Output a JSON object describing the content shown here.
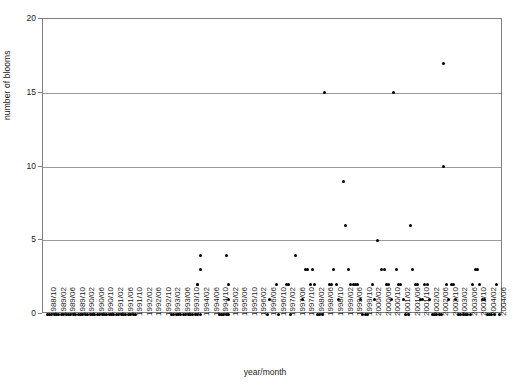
{
  "chart_data": {
    "type": "scatter",
    "title": "",
    "xlabel": "year/month",
    "ylabel": "number of blooms",
    "ylim": [
      0,
      20
    ],
    "yticks": [
      0,
      5,
      10,
      15,
      20
    ],
    "grid": true,
    "legend": false,
    "xtick_labels": [
      "1988/10",
      "1989/02",
      "1989/06",
      "1989/10",
      "1990/02",
      "1990/06",
      "1990/10",
      "1991/02",
      "1991/06",
      "1991/10",
      "1992/02",
      "1992/06",
      "1992/10",
      "1993/02",
      "1993/06",
      "1993/10",
      "1994/02",
      "1994/06",
      "1994/10",
      "1995/02",
      "1995/06",
      "1995/10",
      "1996/02",
      "1996/06",
      "1996/10",
      "1997/02",
      "1997/06",
      "1997/10",
      "1998/02",
      "1998/06",
      "1998/10",
      "1999/02",
      "1999/06",
      "1999/10",
      "2000/02",
      "2000/06",
      "2000/10",
      "2001/02",
      "2001/06",
      "2001/10",
      "2002/02",
      "2002/06",
      "2002/10",
      "2003/02",
      "2003/06",
      "2003/10",
      "2004/02",
      "2004/06"
    ],
    "xtick_step_months": 4,
    "x_start": "1988/10",
    "x_end": "2004/07",
    "x_index_range": [
      0,
      189
    ],
    "point_color": "#000000",
    "axis_color": "#7f7f7f",
    "grid_color": "#9a9a9a",
    "points": [
      [
        0,
        0
      ],
      [
        1,
        0
      ],
      [
        2,
        0
      ],
      [
        3,
        0
      ],
      [
        4,
        0
      ],
      [
        5,
        0
      ],
      [
        6,
        0
      ],
      [
        7,
        0
      ],
      [
        8,
        0
      ],
      [
        9,
        0
      ],
      [
        10,
        0
      ],
      [
        11,
        0
      ],
      [
        12,
        0
      ],
      [
        13,
        0
      ],
      [
        14,
        0
      ],
      [
        15,
        0
      ],
      [
        16,
        0
      ],
      [
        17,
        0
      ],
      [
        18,
        0
      ],
      [
        19,
        0
      ],
      [
        20,
        0
      ],
      [
        21,
        0
      ],
      [
        22,
        0
      ],
      [
        23,
        0
      ],
      [
        24,
        0
      ],
      [
        25,
        0
      ],
      [
        26,
        0
      ],
      [
        27,
        0
      ],
      [
        28,
        0
      ],
      [
        29,
        0
      ],
      [
        30,
        0
      ],
      [
        31,
        0
      ],
      [
        32,
        0
      ],
      [
        33,
        0
      ],
      [
        34,
        0
      ],
      [
        35,
        0
      ],
      [
        36,
        0
      ],
      [
        37,
        0
      ],
      [
        52,
        0
      ],
      [
        53,
        0
      ],
      [
        54,
        0
      ],
      [
        55,
        0
      ],
      [
        56,
        0
      ],
      [
        57,
        0
      ],
      [
        58,
        0
      ],
      [
        59,
        0
      ],
      [
        60,
        0
      ],
      [
        61,
        0
      ],
      [
        62,
        0
      ],
      [
        63,
        0
      ],
      [
        64,
        0
      ],
      [
        63,
        2
      ],
      [
        63,
        2
      ],
      [
        64,
        4
      ],
      [
        64,
        3
      ],
      [
        72,
        0
      ],
      [
        73,
        0
      ],
      [
        74,
        0
      ],
      [
        75,
        0
      ],
      [
        76,
        0
      ],
      [
        75,
        4
      ],
      [
        76,
        2
      ],
      [
        76,
        1
      ],
      [
        92,
        0
      ],
      [
        93,
        1
      ],
      [
        96,
        2
      ],
      [
        97,
        0
      ],
      [
        100,
        2
      ],
      [
        101,
        2
      ],
      [
        102,
        0
      ],
      [
        104,
        4
      ],
      [
        107,
        1
      ],
      [
        108,
        3
      ],
      [
        109,
        3
      ],
      [
        110,
        2
      ],
      [
        111,
        3
      ],
      [
        112,
        2
      ],
      [
        113,
        0
      ],
      [
        114,
        0
      ],
      [
        115,
        0
      ],
      [
        116,
        15
      ],
      [
        118,
        2
      ],
      [
        119,
        2
      ],
      [
        120,
        3
      ],
      [
        121,
        2
      ],
      [
        122,
        1
      ],
      [
        124,
        9
      ],
      [
        125,
        6
      ],
      [
        126,
        3
      ],
      [
        127,
        2
      ],
      [
        128,
        2
      ],
      [
        129,
        2
      ],
      [
        130,
        2
      ],
      [
        131,
        1
      ],
      [
        132,
        0
      ],
      [
        133,
        0
      ],
      [
        134,
        0
      ],
      [
        136,
        2
      ],
      [
        137,
        1
      ],
      [
        138,
        5
      ],
      [
        140,
        3
      ],
      [
        141,
        3
      ],
      [
        142,
        2
      ],
      [
        143,
        2
      ],
      [
        144,
        1
      ],
      [
        145,
        15
      ],
      [
        146,
        3
      ],
      [
        147,
        2
      ],
      [
        148,
        2
      ],
      [
        149,
        1
      ],
      [
        150,
        0
      ],
      [
        151,
        0
      ],
      [
        152,
        6
      ],
      [
        153,
        3
      ],
      [
        154,
        2
      ],
      [
        155,
        2
      ],
      [
        156,
        1
      ],
      [
        157,
        1
      ],
      [
        158,
        2
      ],
      [
        159,
        2
      ],
      [
        160,
        1
      ],
      [
        161,
        0
      ],
      [
        162,
        0
      ],
      [
        163,
        0
      ],
      [
        164,
        0
      ],
      [
        165,
        0
      ],
      [
        166,
        10
      ],
      [
        166,
        17
      ],
      [
        167,
        2
      ],
      [
        168,
        1
      ],
      [
        169,
        2
      ],
      [
        170,
        2
      ],
      [
        171,
        1
      ],
      [
        172,
        0
      ],
      [
        173,
        0
      ],
      [
        174,
        0
      ],
      [
        175,
        0
      ],
      [
        176,
        0
      ],
      [
        177,
        0
      ],
      [
        178,
        2
      ],
      [
        179,
        3
      ],
      [
        180,
        3
      ],
      [
        181,
        2
      ],
      [
        182,
        1
      ],
      [
        183,
        1
      ],
      [
        184,
        0
      ],
      [
        185,
        0
      ],
      [
        186,
        0
      ],
      [
        187,
        0
      ],
      [
        188,
        2
      ],
      [
        189,
        0
      ]
    ]
  }
}
